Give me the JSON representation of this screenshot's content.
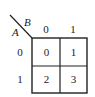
{
  "kmap": {
    "row_variable": "A",
    "col_variable": "B",
    "col_headers": [
      "0",
      "1"
    ],
    "row_headers": [
      "0",
      "1"
    ],
    "cells": [
      [
        "0",
        "1"
      ],
      [
        "2",
        "3"
      ]
    ]
  },
  "colors": {
    "line": "#222222",
    "background": "#ffffff"
  }
}
